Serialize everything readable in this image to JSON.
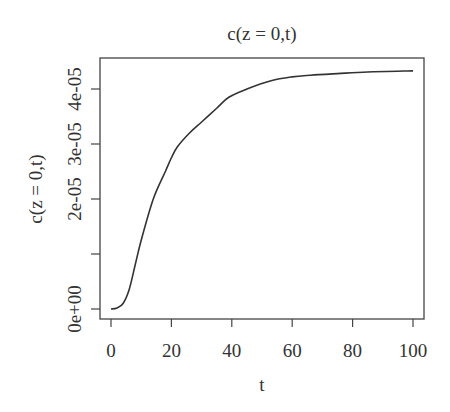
{
  "chart_data": {
    "type": "line",
    "title": "c(z = 0,t)",
    "xlabel": "t",
    "ylabel": "c(z = 0,t)",
    "xlim": [
      0,
      100
    ],
    "ylim": [
      0,
      4.4e-05
    ],
    "grid": false,
    "legend": null,
    "x_ticks": [
      0,
      20,
      40,
      60,
      80,
      100
    ],
    "x_tick_labels": [
      "0",
      "20",
      "40",
      "60",
      "80",
      "100"
    ],
    "y_ticks": [
      0,
      1e-05,
      2e-05,
      3e-05,
      4e-05
    ],
    "y_tick_labels": [
      "0e+00",
      "",
      "2e-05",
      "3e-05",
      "4e-05"
    ],
    "series": [
      {
        "name": "c(z = 0,t)",
        "color": "#333333",
        "x": [
          0,
          2,
          4,
          6,
          8,
          10,
          14,
          18,
          20,
          22,
          26,
          30,
          35,
          39,
          45,
          53,
          60,
          66,
          75,
          85,
          100
        ],
        "values": [
          0,
          2e-07,
          1e-06,
          3.5e-06,
          8e-06,
          1.25e-05,
          2e-05,
          2.5e-05,
          2.75e-05,
          2.95e-05,
          3.2e-05,
          3.4e-05,
          3.65e-05,
          3.85e-05,
          4e-05,
          4.15e-05,
          4.22e-05,
          4.25e-05,
          4.28e-05,
          4.31e-05,
          4.33e-05
        ]
      }
    ]
  }
}
